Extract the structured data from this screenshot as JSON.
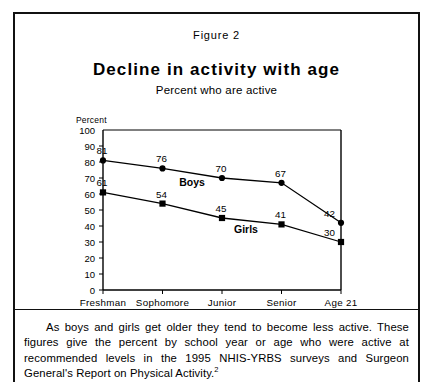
{
  "figure": {
    "label": "Figure  2",
    "title": "Decline  in  activity  with  age",
    "subtitle": "Percent who are active",
    "caption": "As boys and girls get older they tend to become less active. These figures give the percent by school year or age who were active at recommended levels in the 1995 NHIS-YRBS surveys and Surgeon General's Report on Physical Activity.",
    "caption_footnote_marker": "2"
  },
  "chart_data": {
    "type": "line",
    "title": "Decline in activity with age",
    "subtitle": "Percent who are active",
    "xlabel": "",
    "ylabel": "Percent",
    "ylim": [
      0,
      100
    ],
    "ytick_step": 10,
    "yticks": [
      "100",
      "90",
      "80",
      "70",
      "60",
      "50",
      "40",
      "30",
      "20",
      "10",
      "0"
    ],
    "ytick_values": [
      100,
      90,
      80,
      70,
      60,
      50,
      40,
      30,
      20,
      10,
      0
    ],
    "categories": [
      "Freshman",
      "Sophomore",
      "Junior",
      "Senior",
      "Age 21"
    ],
    "grid": false,
    "legend_position": "inline-labels",
    "series": [
      {
        "name": "Boys",
        "marker": "circle",
        "values": [
          81,
          76,
          70,
          67,
          42
        ],
        "labels": [
          "81",
          "76",
          "70",
          "67",
          "42"
        ]
      },
      {
        "name": "Girls",
        "marker": "square",
        "values": [
          61,
          54,
          45,
          41,
          30
        ],
        "labels": [
          "61",
          "54",
          "45",
          "41",
          "30"
        ]
      }
    ],
    "colors": {
      "line": "#000000",
      "marker": "#000000",
      "axis": "#000000",
      "background": "#ffffff"
    }
  }
}
